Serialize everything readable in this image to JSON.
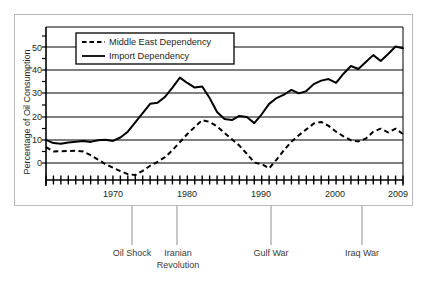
{
  "figure": {
    "background": "#ffffff",
    "frame_color": "#b9b9b9",
    "line_color": "#000000"
  },
  "chart_data": {
    "type": "line",
    "title": "",
    "subtitle": "",
    "xlabel": "",
    "ylabel": "Percentage of Oil Consumption",
    "xlim": [
      1961,
      2009
    ],
    "ylim": [
      -8,
      57
    ],
    "grid": true,
    "grid_axis": "y",
    "legend_position": "top-center-inside",
    "y_ticks": [
      0,
      10,
      20,
      30,
      40,
      50
    ],
    "y_tick_labels": [
      "0",
      "10",
      "20",
      "30",
      "40",
      "50"
    ],
    "x_ticks": [
      1970,
      1980,
      1990,
      2000,
      2009
    ],
    "x_tick_labels": [
      "1970",
      "1980",
      "1990",
      "2000",
      "2009"
    ],
    "x_minor_ticks_every": 1,
    "x": [
      1961,
      1962,
      1963,
      1964,
      1965,
      1966,
      1967,
      1968,
      1969,
      1970,
      1971,
      1972,
      1973,
      1974,
      1975,
      1976,
      1977,
      1978,
      1979,
      1980,
      1981,
      1982,
      1983,
      1984,
      1985,
      1986,
      1987,
      1988,
      1989,
      1990,
      1991,
      1992,
      1993,
      1994,
      1995,
      1996,
      1997,
      1998,
      1999,
      2000,
      2001,
      2002,
      2003,
      2004,
      2005,
      2006,
      2007,
      2008,
      2009
    ],
    "series": [
      {
        "name": "Import Dependency",
        "style": "solid",
        "color": "#000000",
        "values": [
          10.0,
          8.6,
          8.3,
          8.8,
          9.2,
          9.5,
          9.1,
          9.8,
          10.0,
          9.5,
          11.0,
          13.5,
          17.5,
          21.5,
          25.5,
          26.0,
          28.5,
          32.5,
          36.8,
          34.5,
          32.5,
          33.0,
          28.0,
          22.0,
          19.0,
          18.5,
          20.3,
          19.8,
          17.2,
          21.0,
          25.5,
          28.0,
          29.5,
          31.5,
          30.0,
          31.0,
          34.0,
          35.5,
          36.2,
          34.5,
          38.5,
          41.8,
          40.5,
          43.5,
          46.5,
          44.0,
          47.0,
          50.2,
          49.5
        ]
      },
      {
        "name": "Middle East Dependency",
        "style": "dashed",
        "color": "#000000",
        "values": [
          6.8,
          5.0,
          5.1,
          5.2,
          5.3,
          5.0,
          3.4,
          1.5,
          -0.5,
          -2.0,
          -3.5,
          -4.8,
          -5.2,
          -3.4,
          -1.2,
          0.5,
          2.5,
          5.5,
          9.0,
          12.5,
          15.5,
          18.5,
          17.7,
          15.8,
          13.0,
          10.2,
          7.5,
          4.0,
          0.2,
          -0.5,
          -2.3,
          1.5,
          5.5,
          9.2,
          12.0,
          14.5,
          17.0,
          17.7,
          16.0,
          13.5,
          11.5,
          9.8,
          9.3,
          10.5,
          13.5,
          14.8,
          13.2,
          14.8,
          12.5
        ]
      }
    ],
    "annotations": [
      {
        "label": "Oil Shock",
        "label_line2": "",
        "year": 1973,
        "leader_x": 132
      },
      {
        "label": "Iranian",
        "label_line2": "Revolution",
        "year": 1979,
        "leader_x": 177
      },
      {
        "label": "Gulf War",
        "label_line2": "",
        "year": 1991,
        "leader_x": 271
      },
      {
        "label": "Iraq War",
        "label_line2": "",
        "year": 2003,
        "leader_x": 362
      }
    ]
  },
  "legend": {
    "entries": [
      {
        "label": "Middle East Dependency",
        "style": "dashed"
      },
      {
        "label": "Import Dependency",
        "style": "solid"
      }
    ]
  }
}
